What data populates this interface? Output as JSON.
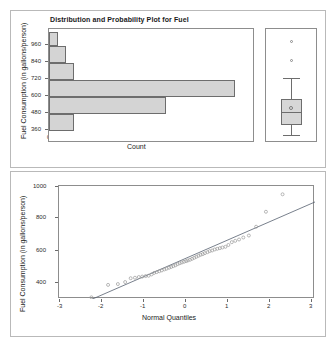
{
  "figure": {
    "title": "Distribution and Probability Plot for Fuel",
    "background_color": "#ffffff",
    "frame_color": "#b9b9b9",
    "bar_fill": "#d4d4d4",
    "bar_edge": "#6d6d6d",
    "point_color": "#9a9a9a",
    "line_color": "#55606e"
  },
  "chart_data": [
    {
      "type": "bar",
      "name": "histogram-fuel-consumption",
      "orientation": "horizontal",
      "title": "Distribution and Probability Plot for Fuel",
      "xlabel": "Count",
      "ylabel": "Fuel Consumption (in gallons/person)",
      "categories": [
        360,
        420,
        480,
        540,
        600,
        660,
        720,
        780,
        840,
        900,
        960,
        1020
      ],
      "bin_width": 60,
      "bins": [
        {
          "bin_center": 330,
          "bin_low": 300,
          "bin_high": 360,
          "count": 3
        },
        {
          "bin_center": 450,
          "bin_low": 360,
          "bin_high": 540,
          "count": 15
        },
        {
          "bin_center": 570,
          "bin_low": 540,
          "bin_high": 660,
          "count": 24
        },
        {
          "bin_center": 690,
          "bin_low": 660,
          "bin_high": 780,
          "count": 3
        },
        {
          "bin_center": 810,
          "bin_low": 780,
          "bin_high": 900,
          "count": 2
        },
        {
          "bin_center": 930,
          "bin_low": 900,
          "bin_high": 990,
          "count": 1
        }
      ],
      "values": [
        3,
        15,
        24,
        3,
        2,
        1
      ],
      "x_ticks": [
        0,
        5,
        10,
        15,
        20,
        25
      ],
      "y_ticks": [
        360,
        480,
        600,
        720,
        840,
        960
      ],
      "xlim": [
        0,
        26
      ],
      "ylim": [
        300,
        1000
      ],
      "grid": false,
      "legend": "none"
    },
    {
      "type": "boxplot",
      "name": "boxplot-fuel-consumption",
      "ylabel": "Fuel Consumption (in gallons/person)",
      "ylim": [
        300,
        1000
      ],
      "minimum": 340,
      "q1": 465,
      "median": 555,
      "mean": 580,
      "q3": 625,
      "maximum": 725,
      "outliers": [
        845,
        960
      ],
      "grid": false,
      "legend": "none"
    },
    {
      "type": "scatter",
      "name": "normal-probability-plot-fuel",
      "xlabel": "Normal Quantiles",
      "ylabel": "Fuel Consumption (in gallons/person)",
      "x_ticks": [
        -3,
        -2,
        -1,
        0,
        1,
        2,
        3
      ],
      "y_ticks": [
        400,
        600,
        800,
        1000
      ],
      "xlim": [
        -3,
        3
      ],
      "ylim": [
        330,
        1010
      ],
      "grid": false,
      "legend": "none",
      "reference_line": {
        "intercept": 578,
        "slope": 112
      },
      "points": [
        [
          -2.24,
          340
        ],
        [
          -1.85,
          415
        ],
        [
          -1.62,
          420
        ],
        [
          -1.45,
          432
        ],
        [
          -1.32,
          455
        ],
        [
          -1.22,
          458
        ],
        [
          -1.13,
          462
        ],
        [
          -1.05,
          465
        ],
        [
          -0.97,
          468
        ],
        [
          -0.9,
          470
        ],
        [
          -0.83,
          478
        ],
        [
          -0.77,
          487
        ],
        [
          -0.71,
          492
        ],
        [
          -0.65,
          497
        ],
        [
          -0.59,
          502
        ],
        [
          -0.53,
          508
        ],
        [
          -0.48,
          512
        ],
        [
          -0.42,
          518
        ],
        [
          -0.37,
          523
        ],
        [
          -0.32,
          528
        ],
        [
          -0.27,
          533
        ],
        [
          -0.22,
          540
        ],
        [
          -0.17,
          545
        ],
        [
          -0.12,
          550
        ],
        [
          -0.07,
          554
        ],
        [
          -0.02,
          558
        ],
        [
          0.02,
          562
        ],
        [
          0.07,
          566
        ],
        [
          0.12,
          572
        ],
        [
          0.17,
          578
        ],
        [
          0.22,
          584
        ],
        [
          0.27,
          590
        ],
        [
          0.32,
          596
        ],
        [
          0.37,
          600
        ],
        [
          0.42,
          606
        ],
        [
          0.48,
          612
        ],
        [
          0.53,
          618
        ],
        [
          0.59,
          622
        ],
        [
          0.65,
          628
        ],
        [
          0.71,
          632
        ],
        [
          0.77,
          636
        ],
        [
          0.83,
          640
        ],
        [
          0.9,
          644
        ],
        [
          0.97,
          655
        ],
        [
          1.05,
          672
        ],
        [
          1.13,
          680
        ],
        [
          1.22,
          688
        ],
        [
          1.32,
          700
        ],
        [
          1.45,
          712
        ],
        [
          1.62,
          765
        ],
        [
          1.85,
          855
        ],
        [
          2.24,
          960
        ]
      ]
    }
  ],
  "histogram": {
    "title": "Distribution and Probability Plot for Fuel",
    "y_axis_label": "Fuel Consumption (in gallons/person)",
    "x_axis_label": "Count",
    "y_ticks": [
      "960",
      "840",
      "720",
      "600",
      "480",
      "360"
    ],
    "x_ticks": [
      "0",
      "5",
      "10",
      "15",
      "20",
      "25"
    ]
  },
  "qqplot": {
    "y_axis_label": "Fuel Consumption (in gallons/person)",
    "x_axis_label": "Normal Quantiles",
    "y_ticks": [
      "1000",
      "800",
      "600",
      "400"
    ],
    "x_ticks": [
      "-3",
      "-2",
      "-1",
      "0",
      "1",
      "2",
      "3"
    ]
  }
}
